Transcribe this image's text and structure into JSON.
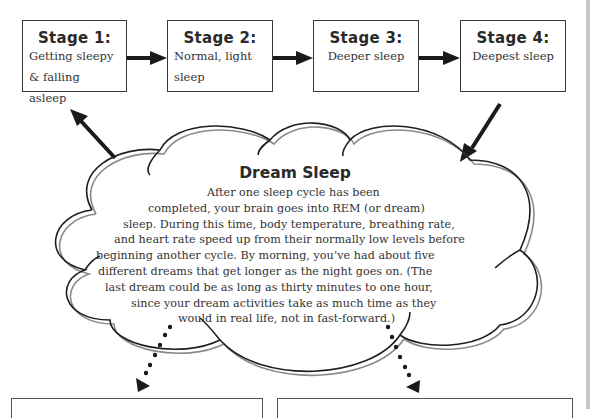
{
  "stages": [
    {
      "title": "Stage 1:",
      "desc_lines": [
        "Getting sleepy",
        "& falling asleep"
      ]
    },
    {
      "title": "Stage 2:",
      "desc_lines": [
        "Normal,  light",
        "sleep"
      ]
    },
    {
      "title": "Stage 3:",
      "desc_lines": [
        "Deeper sleep"
      ]
    },
    {
      "title": "Stage 4:",
      "desc_lines": [
        "Deepest sleep"
      ]
    }
  ],
  "dream": {
    "title": "Dream Sleep",
    "lines": [
      "After one sleep cycle has been",
      "completed, your brain goes into REM (or dream)",
      "sleep. During this time, body temperature, breathing rate,",
      "and heart rate speed up from their normally low levels before",
      "beginning another cycle. By morning, you’ve had about five",
      "different dreams that get longer as the night goes on. (The",
      "last dream could be as long as thirty minutes to one hour,",
      "since your dream activities take as much time as they",
      "would in real life, not in fast-forward.)"
    ]
  },
  "colors": {
    "ink": "#2a2a2a",
    "cloud_shadow": "#8a8a8a",
    "edge": "#c8c8c8"
  }
}
